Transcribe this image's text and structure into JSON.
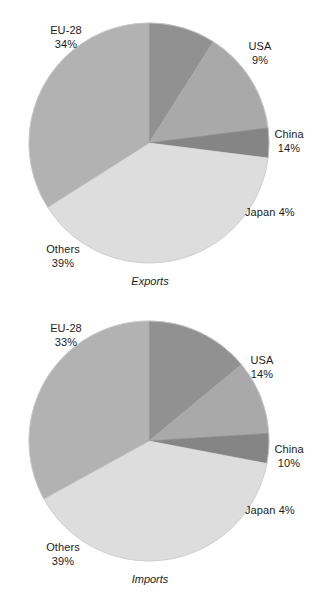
{
  "page": {
    "background_color": "#ffffff",
    "text_color": "#1b1b1b"
  },
  "palette": {
    "eu28": "#b2b2b2",
    "usa": "#919191",
    "china": "#a9a9a9",
    "japan": "#858585",
    "others": "#dddddd",
    "outline": "#c9c9c9"
  },
  "chart_data": [
    {
      "type": "pie",
      "id": "exports",
      "title": "Exports",
      "caption": "Exports",
      "unit": "percent",
      "start_angle_deg": 0,
      "direction": "clockwise",
      "categories": [
        "USA",
        "China",
        "Japan",
        "Others",
        "EU-28"
      ],
      "values": [
        9,
        14,
        4,
        39,
        34
      ],
      "slices": [
        {
          "label": "USA",
          "value": 9,
          "value_text": "9%",
          "color": "#919191"
        },
        {
          "label": "China",
          "value": 14,
          "value_text": "14%",
          "color": "#a9a9a9"
        },
        {
          "label": "Japan",
          "value": 4,
          "value_text": "4%",
          "color": "#858585"
        },
        {
          "label": "Others",
          "value": 39,
          "value_text": "39%",
          "color": "#dddddd"
        },
        {
          "label": "EU-28",
          "value": 34,
          "value_text": "34%",
          "color": "#b2b2b2"
        }
      ],
      "labels": {
        "eu28": {
          "name": "EU-28",
          "pct": "34%"
        },
        "usa": {
          "name": "USA",
          "pct": "9%"
        },
        "china": {
          "name": "China",
          "pct": "14%"
        },
        "japan": {
          "name": "Japan",
          "pct": "4%"
        },
        "japan_inline": "Japan 4%",
        "others": {
          "name": "Others",
          "pct": "39%"
        }
      }
    },
    {
      "type": "pie",
      "id": "imports",
      "title": "Imports",
      "caption": "Imports",
      "unit": "percent",
      "start_angle_deg": 0,
      "direction": "clockwise",
      "categories": [
        "USA",
        "China",
        "Japan",
        "Others",
        "EU-28"
      ],
      "values": [
        14,
        10,
        4,
        39,
        33
      ],
      "slices": [
        {
          "label": "USA",
          "value": 14,
          "value_text": "14%",
          "color": "#919191"
        },
        {
          "label": "China",
          "value": 10,
          "value_text": "10%",
          "color": "#a9a9a9"
        },
        {
          "label": "Japan",
          "value": 4,
          "value_text": "4%",
          "color": "#858585"
        },
        {
          "label": "Others",
          "value": 39,
          "value_text": "39%",
          "color": "#dddddd"
        },
        {
          "label": "EU-28",
          "value": 33,
          "value_text": "33%",
          "color": "#b2b2b2"
        }
      ],
      "labels": {
        "eu28": {
          "name": "EU-28",
          "pct": "33%"
        },
        "usa": {
          "name": "USA",
          "pct": "14%"
        },
        "china": {
          "name": "China",
          "pct": "10%"
        },
        "japan": {
          "name": "Japan",
          "pct": "4%"
        },
        "japan_inline": "Japan 4%",
        "others": {
          "name": "Others",
          "pct": "39%"
        }
      }
    }
  ]
}
